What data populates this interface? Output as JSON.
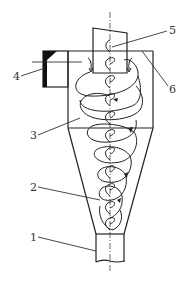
{
  "diagram": {
    "type": "cyclone-separator-schematic",
    "colors": {
      "line": "#222222",
      "background": "#ffffff",
      "fill": "#111111"
    },
    "labels": [
      {
        "id": "1",
        "text": "1",
        "x": 30,
        "y": 241
      },
      {
        "id": "2",
        "text": "2",
        "x": 30,
        "y": 191
      },
      {
        "id": "3",
        "text": "3",
        "x": 30,
        "y": 139
      },
      {
        "id": "4",
        "text": "4",
        "x": 13,
        "y": 80
      },
      {
        "id": "5",
        "text": "5",
        "x": 169,
        "y": 34
      },
      {
        "id": "6",
        "text": "6",
        "x": 169,
        "y": 93
      }
    ]
  }
}
